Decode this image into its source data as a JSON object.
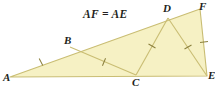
{
  "figure": {
    "caption": "AF = AE",
    "colors": {
      "fill": "#f6f1c4",
      "stroke": "#c9bd73",
      "tick": "#8a7f3c",
      "label": "#231f20",
      "background": "#ffffff"
    },
    "vertices": [
      {
        "id": "A",
        "label": "A",
        "x": 10,
        "y": 77
      },
      {
        "id": "B",
        "label": "B",
        "x": 70,
        "y": 47
      },
      {
        "id": "C",
        "label": "C",
        "x": 136,
        "y": 75
      },
      {
        "id": "D",
        "label": "D",
        "x": 168,
        "y": 18
      },
      {
        "id": "F",
        "label": "F",
        "x": 200,
        "y": 9
      },
      {
        "id": "E",
        "label": "E",
        "x": 207,
        "y": 76
      }
    ],
    "outline": "A,F,E",
    "segments": [
      {
        "name": "A-F",
        "from": "A",
        "to": "F",
        "ticks": 0
      },
      {
        "name": "A-E",
        "from": "A",
        "to": "E",
        "ticks": 0
      },
      {
        "name": "F-E",
        "from": "F",
        "to": "E",
        "ticks": 1
      },
      {
        "name": "B-C",
        "from": "B",
        "to": "C",
        "ticks": 1
      },
      {
        "name": "C-D",
        "from": "C",
        "to": "D",
        "ticks": 1
      },
      {
        "name": "D-E",
        "from": "D",
        "to": "E",
        "ticks": 1
      },
      {
        "name": "A-B",
        "from": "A",
        "to": "B",
        "ticks": 1
      }
    ],
    "tick_marks": [
      {
        "on": "A-B",
        "x": 41,
        "y": 62,
        "angle": -27
      },
      {
        "on": "B-C",
        "x": 104,
        "y": 62,
        "angle": 23
      },
      {
        "on": "C-D",
        "x": 152,
        "y": 46,
        "angle": -61
      },
      {
        "on": "D-E",
        "x": 188,
        "y": 47,
        "angle": 61
      },
      {
        "on": "F-E",
        "x": 204,
        "y": 42,
        "angle": 84
      }
    ]
  }
}
